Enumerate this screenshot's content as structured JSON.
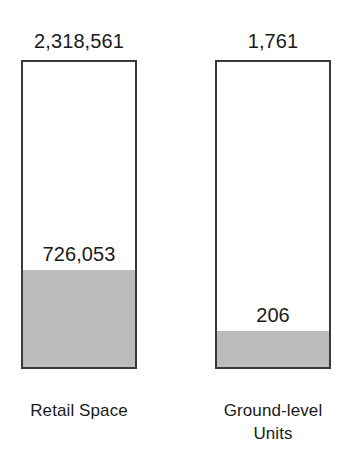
{
  "chart_data": {
    "type": "bar",
    "title": "",
    "subtitle": "",
    "xlabel": "",
    "ylabel": "",
    "grid": false,
    "legend": "none",
    "stacked": true,
    "axis_visible": false,
    "note": "Two independent normalized stacked bars; each bar's full height is its own total, shaded portion is the sub-value.",
    "categories": [
      "Retail Space",
      "Ground-level Units"
    ],
    "series": [
      {
        "name": "Shaded portion",
        "values": [
          726053,
          206
        ],
        "color": "#bcbcbc"
      },
      {
        "name": "Remainder",
        "values": [
          1592508,
          1555
        ],
        "color": "#ffffff"
      }
    ],
    "totals": [
      2318561,
      1761
    ],
    "shaded_share_percent": [
      31.3,
      11.7
    ],
    "bars": [
      {
        "category": "Retail Space",
        "category_lines": [
          "Retail Space"
        ],
        "total_value": 2318561,
        "total_label": "2,318,561",
        "segment_value": 726053,
        "segment_label": "726,053",
        "segment_fraction": 0.313
      },
      {
        "category": "Ground-level Units",
        "category_lines": [
          "Ground-level",
          "Units"
        ],
        "total_value": 1761,
        "total_label": "1,761",
        "segment_value": 206,
        "segment_label": "206",
        "segment_fraction": 0.117
      }
    ]
  },
  "colors": {
    "background": "#ffffff",
    "bar_border": "#3a3a3a",
    "bar_unfilled": "#ffffff",
    "bar_filled": "#bcbcbc",
    "text": "#1a1a1a"
  }
}
